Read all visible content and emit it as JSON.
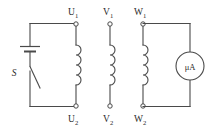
{
  "figure": {
    "kind": "electrical-circuit-diagram",
    "background_color": "#ffffff",
    "line_color": "#4a4a4a",
    "text_color": "#2b2b2b"
  },
  "terminals": {
    "u1": {
      "label_base": "U",
      "label_sub": "1",
      "full": "U1"
    },
    "u2": {
      "label_base": "U",
      "label_sub": "2",
      "full": "U2"
    },
    "v1": {
      "label_base": "V",
      "label_sub": "1",
      "full": "V1"
    },
    "v2": {
      "label_base": "V",
      "label_sub": "2",
      "full": "V2"
    },
    "w1": {
      "label_base": "W",
      "label_sub": "1",
      "full": "W1"
    },
    "w2": {
      "label_base": "W",
      "label_sub": "2",
      "full": "W2"
    }
  },
  "components": {
    "battery": {
      "name": "battery-cell",
      "label": ""
    },
    "switch": {
      "name": "switch",
      "label": "S"
    },
    "meter": {
      "name": "microammeter",
      "label": "μA"
    },
    "coil_u": {
      "name": "coil-u",
      "turns": 4
    },
    "coil_v": {
      "name": "coil-v",
      "turns": 4
    },
    "coil_w": {
      "name": "coil-w",
      "turns": 4
    }
  }
}
